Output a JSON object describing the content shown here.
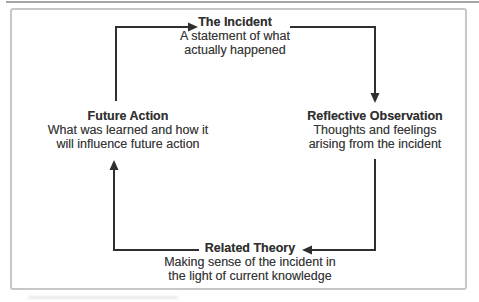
{
  "diagram": {
    "type": "cycle-diagram",
    "nodes": {
      "incident": {
        "title": "The Incident",
        "line1": "A statement of what",
        "line2": "actually happened"
      },
      "reflective": {
        "title": "Reflective Observation",
        "line1": "Thoughts and feelings",
        "line2": "arising from the incident"
      },
      "related": {
        "title": "Related Theory",
        "line1": "Making sense of the incident in",
        "line2": "the light of current knowledge"
      },
      "future": {
        "title": "Future Action",
        "line1": "What was learned and how it",
        "line2": "will influence future action"
      }
    },
    "arrows": [
      {
        "from": "Future Action",
        "to": "The Incident",
        "direction": "up-then-right"
      },
      {
        "from": "The Incident",
        "to": "Reflective Observation",
        "direction": "right-then-down"
      },
      {
        "from": "Reflective Observation",
        "to": "Related Theory",
        "direction": "down-then-left"
      },
      {
        "from": "Related Theory",
        "to": "Future Action",
        "direction": "left-then-up"
      }
    ],
    "colors": {
      "line": "#2f2f2f",
      "text": "#383838",
      "frame_border": "#c7c7c7",
      "top_rule": "#9b9b9b",
      "background": "#ffffff"
    }
  }
}
